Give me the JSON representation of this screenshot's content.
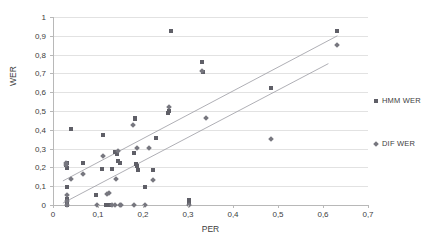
{
  "chart_data": {
    "type": "scatter",
    "title": "",
    "xlabel": "PER",
    "ylabel": "WER",
    "xlim": [
      0,
      0.7
    ],
    "ylim": [
      0,
      1
    ],
    "grid": "horizontal",
    "legend_position": "right",
    "xticks": [
      "0",
      "0,1",
      "0,2",
      "0,3",
      "0,4",
      "0,5",
      "0,6",
      "0,7"
    ],
    "xtick_values": [
      0,
      0.1,
      0.2,
      0.3,
      0.4,
      0.5,
      0.6,
      0.7
    ],
    "yticks": [
      "0",
      "0,1",
      "0,2",
      "0,3",
      "0,4",
      "0,5",
      "0,6",
      "0,7",
      "0,8",
      "0,9",
      "1"
    ],
    "ytick_values": [
      0,
      0.1,
      0.2,
      0.3,
      0.4,
      0.5,
      0.6,
      0.7,
      0.8,
      0.9,
      1
    ],
    "series": [
      {
        "name": "HMM WER",
        "marker": "square",
        "color": "#5f5f67",
        "points": [
          [
            0.028,
            0.215
          ],
          [
            0.03,
            0.225
          ],
          [
            0.03,
            0.195
          ],
          [
            0.03,
            0.098
          ],
          [
            0.03,
            0.03
          ],
          [
            0.03,
            0.012
          ],
          [
            0.03,
            0.0
          ],
          [
            0.04,
            0.403
          ],
          [
            0.066,
            0.222
          ],
          [
            0.095,
            0.055
          ],
          [
            0.108,
            0.19
          ],
          [
            0.11,
            0.37
          ],
          [
            0.118,
            0.0
          ],
          [
            0.125,
            0.0
          ],
          [
            0.132,
            0.19
          ],
          [
            0.138,
            0.28
          ],
          [
            0.142,
            0.27
          ],
          [
            0.145,
            0.232
          ],
          [
            0.148,
            0.225
          ],
          [
            0.18,
            0.277
          ],
          [
            0.182,
            0.465
          ],
          [
            0.183,
            0.455
          ],
          [
            0.185,
            0.22
          ],
          [
            0.186,
            0.21
          ],
          [
            0.188,
            0.188
          ],
          [
            0.205,
            0.097
          ],
          [
            0.222,
            0.186
          ],
          [
            0.228,
            0.357
          ],
          [
            0.255,
            0.49
          ],
          [
            0.258,
            0.5
          ],
          [
            0.262,
            0.925
          ],
          [
            0.303,
            0.025
          ],
          [
            0.303,
            0.01
          ],
          [
            0.33,
            0.76
          ],
          [
            0.333,
            0.708
          ],
          [
            0.484,
            0.62
          ],
          [
            0.63,
            0.925
          ]
        ]
      },
      {
        "name": "DIF WER",
        "marker": "diamond",
        "color": "#77777f",
        "points": [
          [
            0.028,
            0.222
          ],
          [
            0.029,
            0.212
          ],
          [
            0.03,
            0.055
          ],
          [
            0.03,
            0.022
          ],
          [
            0.03,
            0.0
          ],
          [
            0.04,
            0.137
          ],
          [
            0.067,
            0.163
          ],
          [
            0.097,
            0.0
          ],
          [
            0.112,
            0.26
          ],
          [
            0.12,
            0.06
          ],
          [
            0.124,
            0.063
          ],
          [
            0.13,
            0.0
          ],
          [
            0.138,
            0.0
          ],
          [
            0.14,
            0.14
          ],
          [
            0.144,
            0.285
          ],
          [
            0.148,
            0.0
          ],
          [
            0.15,
            0.0
          ],
          [
            0.178,
            0.425
          ],
          [
            0.18,
            0.0
          ],
          [
            0.186,
            0.302
          ],
          [
            0.205,
            0.0
          ],
          [
            0.214,
            0.305
          ],
          [
            0.222,
            0.134
          ],
          [
            0.258,
            0.522
          ],
          [
            0.303,
            0.0
          ],
          [
            0.33,
            0.712
          ],
          [
            0.34,
            0.462
          ],
          [
            0.484,
            0.353
          ],
          [
            0.63,
            0.852
          ]
        ]
      }
    ],
    "trendlines": [
      {
        "for": "HMM WER",
        "x0": 0.022,
        "y0": 0.128,
        "x1": 0.632,
        "y1": 0.9
      },
      {
        "for": "DIF WER",
        "x0": 0.022,
        "y0": 0.01,
        "x1": 0.612,
        "y1": 0.752
      }
    ]
  },
  "legend": {
    "items": [
      {
        "label": "HMM WER",
        "marker": "square"
      },
      {
        "label": "DIF WER",
        "marker": "diamond"
      }
    ]
  }
}
